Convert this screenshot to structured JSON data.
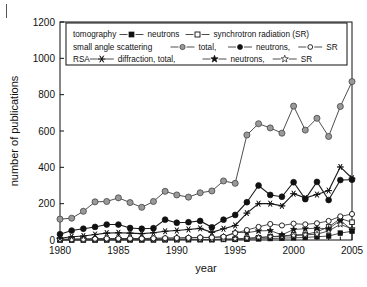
{
  "chart_data": {
    "type": "line",
    "title": "",
    "xlabel": "year",
    "ylabel": "number of publications",
    "xlim": [
      1980,
      2005
    ],
    "ylim": [
      0,
      1200
    ],
    "xticks": [
      1980,
      1985,
      1990,
      1995,
      2000,
      2005
    ],
    "yticks": [
      0,
      200,
      400,
      600,
      800,
      1000,
      1200
    ],
    "xtick_labels": [
      "1980",
      "1985",
      "1990",
      "1995",
      "2000",
      "2005"
    ],
    "ytick_labels": [
      "0",
      "200",
      "400",
      "600",
      "800",
      "1000",
      "1200"
    ],
    "minor_xticks": true,
    "grid": false,
    "legend_position": "upper-left-inside",
    "x": [
      1980,
      1981,
      1982,
      1983,
      1984,
      1985,
      1986,
      1987,
      1988,
      1989,
      1990,
      1991,
      1992,
      1993,
      1994,
      1995,
      1996,
      1997,
      1998,
      1999,
      2000,
      2001,
      2002,
      2003,
      2004,
      2005
    ],
    "series": [
      {
        "name": "small angle scattering, total",
        "marker": "filled-circle-gray",
        "values": [
          115,
          120,
          158,
          210,
          212,
          232,
          206,
          180,
          212,
          268,
          248,
          236,
          260,
          270,
          325,
          312,
          578,
          640,
          617,
          588,
          737,
          605,
          670,
          570,
          735,
          872
        ]
      },
      {
        "name": "small angle scattering, neutrons",
        "marker": "filled-circle",
        "values": [
          32,
          52,
          62,
          72,
          85,
          85,
          66,
          62,
          65,
          112,
          95,
          98,
          105,
          70,
          112,
          138,
          208,
          300,
          248,
          238,
          318,
          225,
          320,
          220,
          330,
          332
        ]
      },
      {
        "name": "RSA diffraction, total",
        "marker": "asterisk",
        "values": [
          10,
          18,
          22,
          30,
          38,
          40,
          38,
          35,
          40,
          48,
          52,
          58,
          64,
          42,
          62,
          80,
          148,
          200,
          200,
          188,
          255,
          232,
          250,
          272,
          402,
          340
        ]
      },
      {
        "name": "small angle scattering, SR",
        "marker": "open-circle",
        "values": [
          4,
          5,
          6,
          7,
          8,
          8,
          8,
          8,
          9,
          10,
          11,
          12,
          14,
          14,
          18,
          38,
          55,
          72,
          88,
          80,
          90,
          86,
          92,
          105,
          130,
          143
        ]
      },
      {
        "name": "tomography, SR",
        "marker": "open-square",
        "values": [
          1,
          1,
          1,
          1,
          2,
          2,
          2,
          2,
          2,
          2,
          3,
          3,
          3,
          3,
          4,
          5,
          8,
          12,
          18,
          22,
          28,
          30,
          45,
          72,
          118,
          98
        ]
      },
      {
        "name": "RSA diffraction, neutrons",
        "marker": "filled-star",
        "values": [
          3,
          4,
          5,
          6,
          7,
          8,
          8,
          8,
          9,
          10,
          11,
          12,
          14,
          14,
          18,
          42,
          40,
          50,
          52,
          28,
          58,
          62,
          65,
          62,
          108,
          55
        ]
      },
      {
        "name": "RSA diffraction, SR",
        "marker": "open-star",
        "values": [
          1,
          1,
          1,
          1,
          1,
          2,
          2,
          2,
          2,
          2,
          2,
          3,
          3,
          3,
          4,
          6,
          10,
          14,
          18,
          20,
          24,
          28,
          32,
          50,
          86,
          62
        ]
      },
      {
        "name": "tomography, neutrons",
        "marker": "filled-square",
        "values": [
          1,
          1,
          1,
          1,
          1,
          1,
          1,
          1,
          1,
          2,
          2,
          2,
          2,
          2,
          3,
          3,
          4,
          6,
          8,
          10,
          12,
          14,
          18,
          22,
          38,
          48
        ]
      }
    ]
  },
  "legend": {
    "rows": [
      {
        "id": "row-tomography",
        "parts": [
          {
            "kind": "text",
            "text": "tomography"
          },
          {
            "kind": "marker",
            "marker": "filled-square"
          },
          {
            "kind": "text",
            "text": "neutrons"
          },
          {
            "kind": "marker",
            "marker": "open-square"
          },
          {
            "kind": "text",
            "text": "synchrotron radiation (SR)"
          }
        ]
      },
      {
        "id": "row-sas",
        "parts": [
          {
            "kind": "text",
            "text": "small angle scattering"
          },
          {
            "kind": "marker",
            "marker": "filled-circle-gray"
          },
          {
            "kind": "text",
            "text": "total,"
          },
          {
            "kind": "marker",
            "marker": "filled-circle"
          },
          {
            "kind": "text",
            "text": "neutrons,"
          },
          {
            "kind": "marker",
            "marker": "open-circle"
          },
          {
            "kind": "text",
            "text": "SR"
          }
        ]
      },
      {
        "id": "row-rsa",
        "parts": [
          {
            "kind": "text",
            "text": "RSA"
          },
          {
            "kind": "marker",
            "marker": "asterisk"
          },
          {
            "kind": "text",
            "text": "diffraction, total,"
          },
          {
            "kind": "marker",
            "marker": "filled-star"
          },
          {
            "kind": "text",
            "text": "neutrons,"
          },
          {
            "kind": "marker",
            "marker": "open-star"
          },
          {
            "kind": "text",
            "text": "SR"
          }
        ]
      }
    ]
  },
  "colors": {
    "axis": "#111111",
    "line": "#3a3a3a",
    "marker_gray": "#999999",
    "marker_dark": "#111111",
    "background": "#ffffff"
  }
}
